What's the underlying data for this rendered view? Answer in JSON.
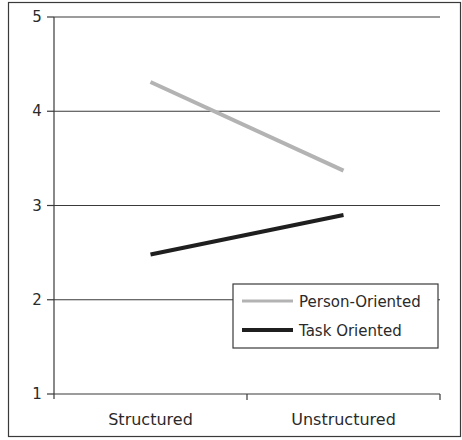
{
  "chart_data": {
    "type": "line",
    "title": "",
    "xlabel": "",
    "ylabel": "",
    "categories": [
      "Structured",
      "Unstructured"
    ],
    "ylim": [
      1,
      5
    ],
    "yticks": [
      "1",
      "2",
      "3",
      "4",
      "5"
    ],
    "grid": true,
    "legend_position": "bottom-right",
    "series": [
      {
        "name": "Person-Oriented",
        "color": "#b3b3b3",
        "values": [
          4.31,
          3.37
        ]
      },
      {
        "name": "Task Oriented",
        "color": "#1f1f1f",
        "values": [
          2.48,
          2.9
        ]
      }
    ]
  }
}
